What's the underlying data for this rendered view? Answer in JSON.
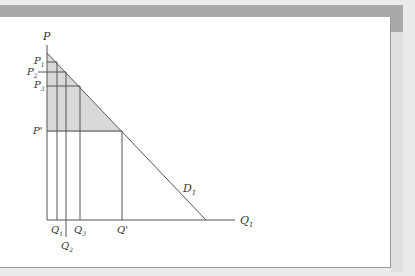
{
  "diagram": {
    "axes": {
      "y_label": "P",
      "x_label": "Q",
      "x_label_sub": "1"
    },
    "demand_curve": {
      "label": "D",
      "label_sub": "1"
    },
    "price_levels": [
      {
        "label": "P",
        "sub": "1"
      },
      {
        "label": "P",
        "sub": "2"
      },
      {
        "label": "P",
        "sub": "3"
      },
      {
        "label": "P'",
        "sub": ""
      }
    ],
    "quantity_levels": [
      {
        "label": "Q",
        "sub": "1"
      },
      {
        "label": "Q",
        "sub": "2"
      },
      {
        "label": "Q",
        "sub": "3"
      },
      {
        "label": "Q'",
        "sub": ""
      }
    ],
    "colors": {
      "shaded_area": "#d9d9d9",
      "lines": "#555555",
      "frame_band": "#a9a9a9"
    }
  }
}
